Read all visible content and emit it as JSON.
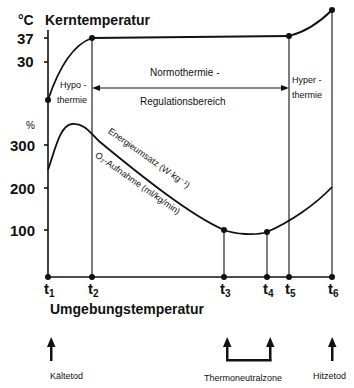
{
  "top_axis": {
    "unit": "°C",
    "title": "Kerntemperatur",
    "ticks": [
      "37",
      "30"
    ]
  },
  "bottom_axis": {
    "unit": "%",
    "ticks": [
      "300",
      "200",
      "100"
    ]
  },
  "regions": {
    "hypo": [
      "Hypo -",
      "thermie"
    ],
    "normo_top": "Normothermie -",
    "normo_bottom": "Regulationsbereich",
    "hyper": [
      "Hyper -",
      "thermie"
    ]
  },
  "curve_labels": {
    "energy": "Energieumsatz (W·kg⁻¹)",
    "oxygen": "O₂-Aufnahme (ml/kg/min)"
  },
  "x_axis": {
    "title": "Umgebungstemperatur",
    "points": [
      {
        "base": "t",
        "sub": "1"
      },
      {
        "base": "t",
        "sub": "2"
      },
      {
        "base": "t",
        "sub": "3"
      },
      {
        "base": "t",
        "sub": "4"
      },
      {
        "base": "t",
        "sub": "5"
      },
      {
        "base": "t",
        "sub": "6"
      }
    ]
  },
  "markers": {
    "cold_death": "Kältetod",
    "thermoneutral": "Thermoneutralzone",
    "heat_death": "Hitzetod"
  }
}
